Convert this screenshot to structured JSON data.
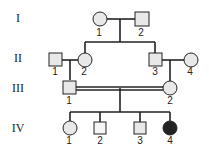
{
  "generations": [
    "I",
    "II",
    "III",
    "IV"
  ],
  "individuals": {
    "I_1": {
      "label": "1",
      "sex": "female",
      "affected": false
    },
    "I_2": {
      "label": "2",
      "sex": "male",
      "affected": false
    },
    "II_1": {
      "label": "1",
      "sex": "male",
      "affected": false
    },
    "II_2": {
      "label": "2",
      "sex": "female",
      "affected": false
    },
    "II_3": {
      "label": "3",
      "sex": "male",
      "affected": false
    },
    "II_4": {
      "label": "4",
      "sex": "female",
      "affected": false
    },
    "III_1": {
      "label": "1",
      "sex": "male",
      "affected": false
    },
    "III_2": {
      "label": "2",
      "sex": "female",
      "affected": false
    },
    "IV_1": {
      "label": "1",
      "sex": "female",
      "affected": false
    },
    "IV_2": {
      "label": "2",
      "sex": "male",
      "affected": false
    },
    "IV_3": {
      "label": "3",
      "sex": "male",
      "affected": false
    },
    "IV_4": {
      "label": "4",
      "sex": "female",
      "affected": true
    }
  },
  "colors": {
    "unaffected": "#e8e8e8",
    "affected": "#222222",
    "line": "#222222"
  },
  "notes": {
    "consanguineous_marriage": "III-1 x III-2 (double line)"
  }
}
